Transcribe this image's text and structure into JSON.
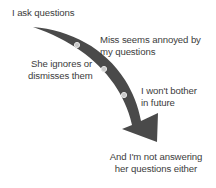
{
  "diagram": {
    "type": "curved-arrow-sequence",
    "colors": {
      "arrow": "#4a4a4a",
      "dot_fill": "#c8c8c8",
      "dot_ring": "#e6e6e6",
      "text": "#3c3c3c",
      "background": "#ffffff"
    },
    "steps": [
      {
        "lines": [
          "I ask questions"
        ]
      },
      {
        "lines": [
          "Miss seems annoyed by",
          "my questions"
        ]
      },
      {
        "lines": [
          "She ignores or",
          "dismisses them"
        ]
      },
      {
        "lines": [
          "I won't bother",
          "in future"
        ]
      },
      {
        "lines": [
          "And I'm not answering",
          "her questions either"
        ]
      }
    ],
    "milestones": [
      {
        "x": 77,
        "y": 45
      },
      {
        "x": 104,
        "y": 69
      },
      {
        "x": 124,
        "y": 95
      }
    ]
  }
}
